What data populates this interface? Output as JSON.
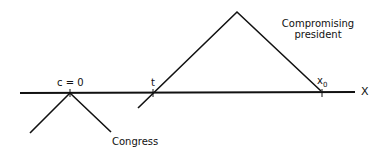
{
  "diagram": {
    "axis": {
      "label": "X"
    },
    "points": {
      "congress_ideal": {
        "label": "c = 0"
      },
      "threshold": {
        "label": "t"
      },
      "status_quo": {
        "label": "x",
        "subscript": "0"
      }
    },
    "curves": {
      "congress": {
        "label": "Congress"
      },
      "president": {
        "label_line1": "Compromising",
        "label_line2": "president"
      }
    }
  }
}
